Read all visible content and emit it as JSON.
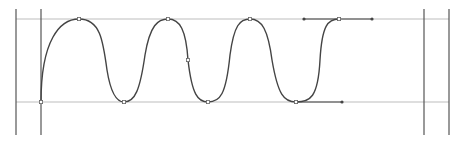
{
  "canvas": {
    "width": 460,
    "height": 144,
    "background": "#ffffff"
  },
  "colors": {
    "frame_line": "#555555",
    "guide_line": "#bdbdbd",
    "curve": "#444444",
    "anchor": "#666666",
    "handle": "#444444"
  },
  "frame": {
    "outer_left_x": 16,
    "inner_left_x": 41,
    "inner_right_x": 424,
    "outer_right_x": 449,
    "top_y": 9,
    "bottom_y": 135
  },
  "guides": {
    "top_y": 19,
    "bottom_y": 102,
    "x_start": 16,
    "x_end": 449
  },
  "curve": {
    "path": "M 41 102 C 41 40, 60 19, 79 19 C 100 19, 103 40, 107 70 C 111 95, 117 102, 124 102 C 135 102, 140 90, 145 55 C 150 25, 158 19, 168 19 C 180 19, 186 30, 188 60 C 192 95, 198 102, 208 102 C 220 102, 226 95, 230 55 C 234 25, 240 19, 250 19 C 262 19, 268 30, 272 60 C 278 95, 284 102, 296 102 C 310 102, 318 98, 320 60 C 322 25, 328 19, 339 19",
    "anchors": [
      {
        "x": 41,
        "y": 102
      },
      {
        "x": 79,
        "y": 19
      },
      {
        "x": 124,
        "y": 102
      },
      {
        "x": 168,
        "y": 19
      },
      {
        "x": 188,
        "y": 60
      },
      {
        "x": 208,
        "y": 102
      },
      {
        "x": 250,
        "y": 19
      },
      {
        "x": 296,
        "y": 102
      },
      {
        "x": 339,
        "y": 19
      }
    ],
    "handles": [
      {
        "x1": 304,
        "y1": 19,
        "x2": 372,
        "y2": 19,
        "anchor_x": 339,
        "anchor_y": 19
      },
      {
        "x1": 296,
        "y1": 102,
        "x2": 342,
        "y2": 102,
        "anchor_x": 296,
        "anchor_y": 102
      }
    ]
  }
}
